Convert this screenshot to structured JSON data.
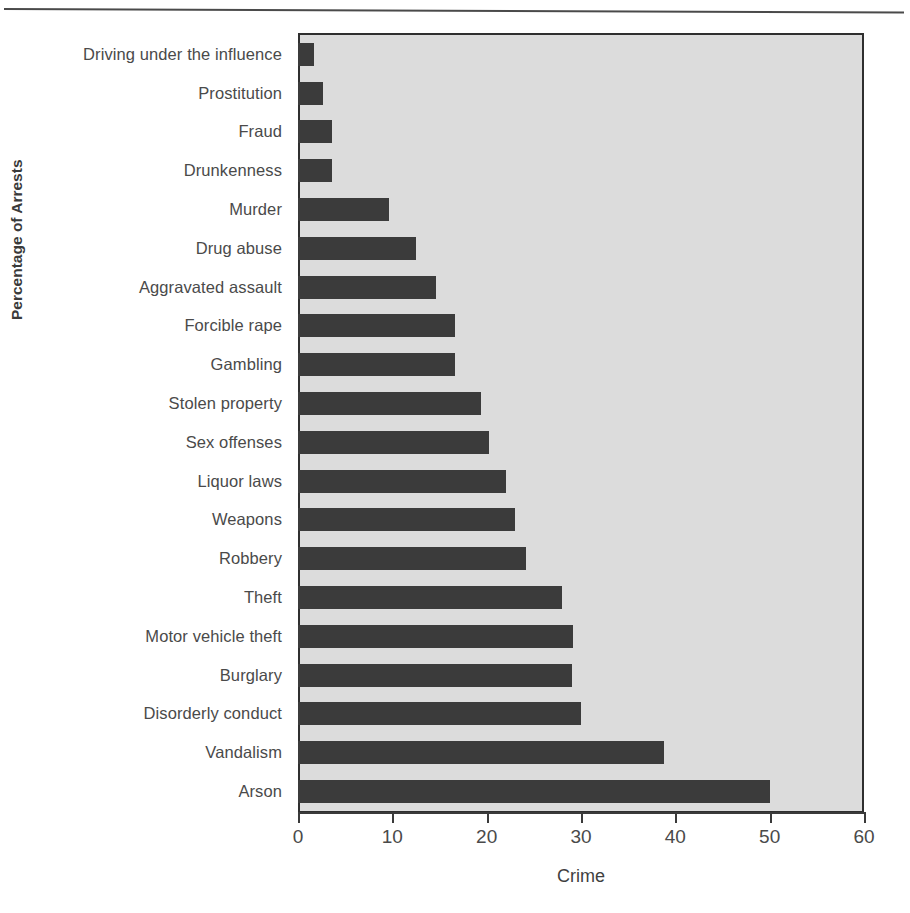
{
  "chart_data": {
    "type": "bar",
    "orientation": "horizontal",
    "title": "",
    "xlabel": "Crime",
    "ylabel": "Percentage of Arrests",
    "xlim": [
      0,
      60
    ],
    "xticks": [
      0,
      10,
      20,
      30,
      40,
      50,
      60
    ],
    "grid": false,
    "legend": null,
    "categories": [
      "Driving under the influence",
      "Prostitution",
      "Fraud",
      "Drunkenness",
      "Murder",
      "Drug abuse",
      "Aggravated assault",
      "Forcible rape",
      "Gambling",
      "Stolen property",
      "Sex offenses",
      "Liquor laws",
      "Weapons",
      "Robbery",
      "Theft",
      "Motor vehicle theft",
      "Burglary",
      "Disorderly conduct",
      "Vandalism",
      "Arson"
    ],
    "values": [
      1.7,
      2.7,
      3.6,
      3.6,
      9.6,
      12.5,
      14.6,
      16.6,
      16.6,
      19.4,
      20.2,
      22.0,
      23.0,
      24.2,
      28.0,
      29.2,
      29.0,
      30.0,
      38.8,
      50.0
    ],
    "bar_color": "#3b3b3b",
    "plot_background": "#dcdcdc",
    "axis_color": "#2f2f2f"
  }
}
